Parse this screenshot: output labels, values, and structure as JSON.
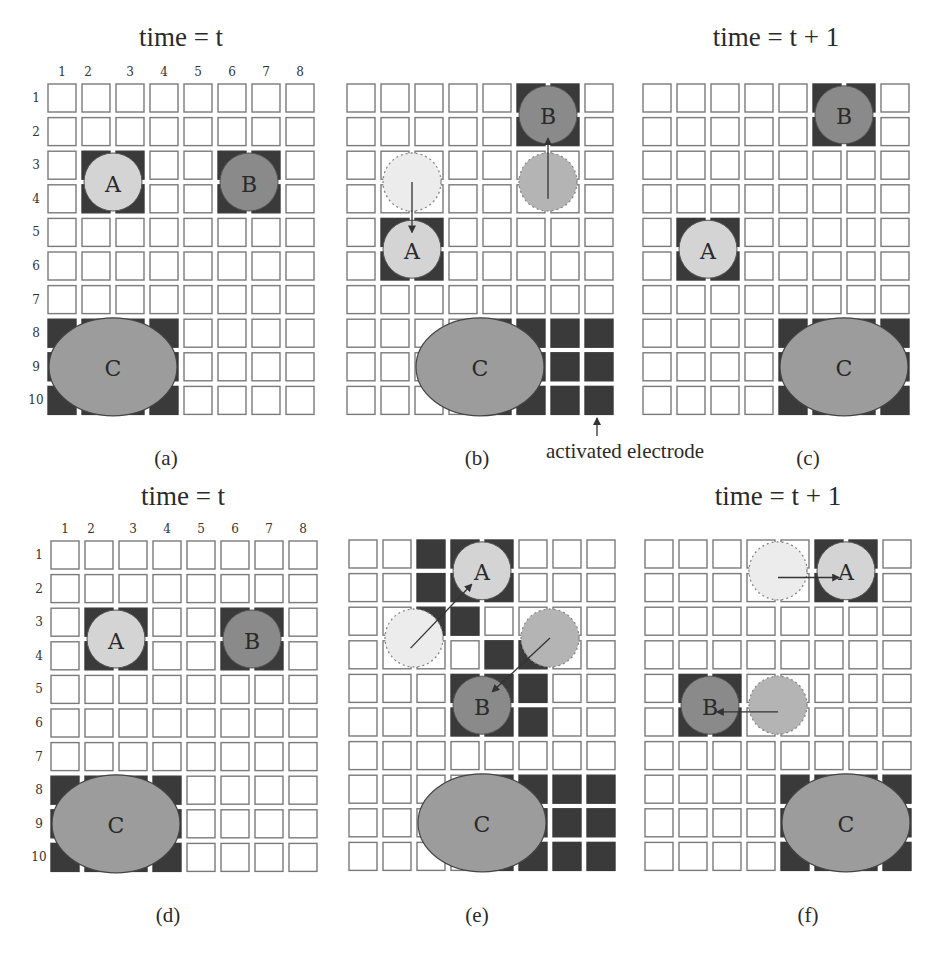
{
  "figure": {
    "grid": {
      "rows": 10,
      "cols": 8,
      "cell_size": 28,
      "pitch_x": 34,
      "pitch_y": 33.6
    },
    "colors": {
      "activated_electrode": "#3a3a3a",
      "droplet_light": "#d4d4d4",
      "droplet_dark": "#8a8a8a",
      "droplet_c": "#9c9c9c",
      "electrode_border": "#7a7a7a"
    },
    "annotation": {
      "label": "activated electrode",
      "x": 625,
      "y": 458,
      "arrow_x": 597,
      "arrow_y1": 436,
      "arrow_y2": 418
    },
    "panels": [
      {
        "id": "a",
        "caption": "(a)",
        "title": "time = t",
        "show_indices": true,
        "origin": [
          48,
          84
        ],
        "active": [
          [
            3,
            2
          ],
          [
            3,
            3
          ],
          [
            4,
            2
          ],
          [
            4,
            3
          ],
          [
            3,
            6
          ],
          [
            3,
            7
          ],
          [
            4,
            6
          ],
          [
            4,
            7
          ],
          [
            8,
            1
          ],
          [
            8,
            2
          ],
          [
            8,
            3
          ],
          [
            8,
            4
          ],
          [
            9,
            1
          ],
          [
            9,
            4
          ],
          [
            10,
            1
          ],
          [
            10,
            2
          ],
          [
            10,
            3
          ],
          [
            10,
            4
          ]
        ],
        "droplets": [
          {
            "label": "A",
            "style": "light",
            "row": 3.5,
            "col": 2.5,
            "r": 29
          },
          {
            "label": "B",
            "style": "dark",
            "row": 3.5,
            "col": 6.5,
            "r": 29
          },
          {
            "label": "C",
            "style": "c",
            "row": 9,
            "col": 2.5,
            "rx": 64,
            "ry": 49
          }
        ],
        "ghosts": [],
        "arrows": []
      },
      {
        "id": "b",
        "caption": "(b)",
        "title": "",
        "show_indices": false,
        "origin": [
          347,
          84
        ],
        "active": [
          [
            1,
            6
          ],
          [
            1,
            7
          ],
          [
            2,
            6
          ],
          [
            2,
            7
          ],
          [
            5,
            2
          ],
          [
            5,
            3
          ],
          [
            6,
            2
          ],
          [
            6,
            3
          ],
          [
            8,
            5
          ],
          [
            8,
            6
          ],
          [
            8,
            7
          ],
          [
            8,
            8
          ],
          [
            9,
            5
          ],
          [
            9,
            6
          ],
          [
            9,
            7
          ],
          [
            9,
            8
          ],
          [
            10,
            5
          ],
          [
            10,
            6
          ],
          [
            10,
            7
          ],
          [
            10,
            8
          ]
        ],
        "droplets": [
          {
            "label": "B",
            "style": "dark",
            "row": 1.5,
            "col": 6.5,
            "r": 29
          },
          {
            "label": "A",
            "style": "light",
            "row": 5.5,
            "col": 2.5,
            "r": 29
          },
          {
            "label": "C",
            "style": "c",
            "row": 9,
            "col": 4.5,
            "rx": 64,
            "ry": 49
          }
        ],
        "ghosts": [
          {
            "style": "light",
            "row": 3.5,
            "col": 2.5,
            "r": 29
          },
          {
            "style": "dark",
            "row": 3.5,
            "col": 6.5,
            "r": 29
          }
        ],
        "arrows": [
          {
            "from": [
              3.5,
              2.5
            ],
            "to": [
              5.0,
              2.5
            ]
          },
          {
            "from": [
              4.0,
              6.5
            ],
            "to": [
              2.2,
              6.5
            ]
          }
        ]
      },
      {
        "id": "c",
        "caption": "(c)",
        "title": "time = t + 1",
        "show_indices": false,
        "origin": [
          643,
          84
        ],
        "active": [
          [
            1,
            6
          ],
          [
            1,
            7
          ],
          [
            2,
            6
          ],
          [
            2,
            7
          ],
          [
            5,
            2
          ],
          [
            5,
            3
          ],
          [
            6,
            2
          ],
          [
            6,
            3
          ],
          [
            8,
            5
          ],
          [
            8,
            6
          ],
          [
            8,
            7
          ],
          [
            8,
            8
          ],
          [
            9,
            5
          ],
          [
            9,
            8
          ],
          [
            10,
            5
          ],
          [
            10,
            6
          ],
          [
            10,
            7
          ],
          [
            10,
            8
          ]
        ],
        "droplets": [
          {
            "label": "B",
            "style": "dark",
            "row": 1.5,
            "col": 6.5,
            "r": 29
          },
          {
            "label": "A",
            "style": "light",
            "row": 5.5,
            "col": 2.5,
            "r": 29
          },
          {
            "label": "C",
            "style": "c",
            "row": 9,
            "col": 6.5,
            "rx": 64,
            "ry": 49
          }
        ],
        "ghosts": [],
        "arrows": []
      },
      {
        "id": "d",
        "caption": "(d)",
        "title": "time = t",
        "show_indices": true,
        "origin": [
          51,
          541
        ],
        "active": [
          [
            3,
            2
          ],
          [
            3,
            3
          ],
          [
            4,
            2
          ],
          [
            4,
            3
          ],
          [
            3,
            6
          ],
          [
            3,
            7
          ],
          [
            4,
            6
          ],
          [
            4,
            7
          ],
          [
            8,
            1
          ],
          [
            8,
            2
          ],
          [
            8,
            3
          ],
          [
            8,
            4
          ],
          [
            9,
            1
          ],
          [
            9,
            4
          ],
          [
            10,
            1
          ],
          [
            10,
            2
          ],
          [
            10,
            3
          ],
          [
            10,
            4
          ]
        ],
        "droplets": [
          {
            "label": "A",
            "style": "light",
            "row": 3.5,
            "col": 2.5,
            "r": 29
          },
          {
            "label": "B",
            "style": "dark",
            "row": 3.5,
            "col": 6.5,
            "r": 29
          },
          {
            "label": "C",
            "style": "c",
            "row": 9,
            "col": 2.5,
            "rx": 64,
            "ry": 49
          }
        ],
        "ghosts": [],
        "arrows": []
      },
      {
        "id": "e",
        "caption": "(e)",
        "title": "",
        "show_indices": false,
        "origin": [
          349,
          540
        ],
        "active": [
          [
            1,
            3
          ],
          [
            1,
            4
          ],
          [
            1,
            5
          ],
          [
            2,
            3
          ],
          [
            2,
            4
          ],
          [
            2,
            5
          ],
          [
            3,
            3
          ],
          [
            3,
            4
          ],
          [
            4,
            5
          ],
          [
            4,
            6
          ],
          [
            5,
            4
          ],
          [
            5,
            5
          ],
          [
            5,
            6
          ],
          [
            6,
            4
          ],
          [
            6,
            5
          ],
          [
            6,
            6
          ],
          [
            8,
            5
          ],
          [
            8,
            6
          ],
          [
            8,
            7
          ],
          [
            8,
            8
          ],
          [
            9,
            5
          ],
          [
            9,
            6
          ],
          [
            9,
            7
          ],
          [
            9,
            8
          ],
          [
            10,
            5
          ],
          [
            10,
            6
          ],
          [
            10,
            7
          ],
          [
            10,
            8
          ]
        ],
        "droplets": [
          {
            "label": "A",
            "style": "light",
            "row": 1.5,
            "col": 4.5,
            "r": 29
          },
          {
            "label": "B",
            "style": "dark",
            "row": 5.5,
            "col": 4.5,
            "r": 29
          },
          {
            "label": "C",
            "style": "c",
            "row": 9,
            "col": 4.5,
            "rx": 64,
            "ry": 49
          }
        ],
        "ghosts": [
          {
            "style": "light",
            "row": 3.5,
            "col": 2.5,
            "r": 29
          },
          {
            "style": "dark",
            "row": 3.5,
            "col": 6.5,
            "r": 29
          }
        ],
        "arrows": [
          {
            "from": [
              3.8,
              2.4
            ],
            "to": [
              1.9,
              4.2
            ]
          },
          {
            "from": [
              3.5,
              6.5
            ],
            "to": [
              5.1,
              4.8
            ]
          }
        ]
      },
      {
        "id": "f",
        "caption": "(f)",
        "title": "time = t + 1",
        "show_indices": false,
        "origin": [
          645,
          540
        ],
        "active": [
          [
            1,
            6
          ],
          [
            1,
            7
          ],
          [
            2,
            6
          ],
          [
            2,
            7
          ],
          [
            5,
            2
          ],
          [
            5,
            3
          ],
          [
            6,
            2
          ],
          [
            6,
            3
          ],
          [
            8,
            5
          ],
          [
            8,
            6
          ],
          [
            8,
            7
          ],
          [
            8,
            8
          ],
          [
            9,
            5
          ],
          [
            9,
            8
          ],
          [
            10,
            5
          ],
          [
            10,
            6
          ],
          [
            10,
            7
          ],
          [
            10,
            8
          ]
        ],
        "droplets": [
          {
            "label": "A",
            "style": "light",
            "row": 1.5,
            "col": 6.5,
            "r": 29
          },
          {
            "label": "B",
            "style": "dark",
            "row": 5.5,
            "col": 2.5,
            "r": 29
          },
          {
            "label": "C",
            "style": "c",
            "row": 9,
            "col": 6.5,
            "rx": 64,
            "ry": 49
          }
        ],
        "ghosts": [
          {
            "style": "light",
            "row": 1.5,
            "col": 4.5,
            "r": 29
          },
          {
            "style": "dark",
            "row": 5.5,
            "col": 4.5,
            "r": 29
          }
        ],
        "arrows": [
          {
            "from": [
              1.7,
              4.5
            ],
            "to": [
              1.7,
              6.3
            ]
          },
          {
            "from": [
              5.7,
              4.5
            ],
            "to": [
              5.7,
              2.7
            ]
          }
        ]
      }
    ],
    "title_positions": {
      "a": [
        181,
        46
      ],
      "c": [
        776,
        46
      ],
      "d": [
        183,
        505
      ],
      "f": [
        778,
        505
      ]
    },
    "caption_positions": {
      "a": [
        166,
        465
      ],
      "b": [
        477,
        465
      ],
      "c": [
        808,
        465
      ],
      "d": [
        168,
        922
      ],
      "e": [
        477,
        922
      ],
      "f": [
        808,
        922
      ]
    },
    "column_indices": [
      "1",
      "2",
      "3",
      "4",
      "5",
      "6",
      "7",
      "8"
    ],
    "row_indices": [
      "1",
      "2",
      "3",
      "4",
      "5",
      "6",
      "7",
      "8",
      "9",
      "10"
    ]
  }
}
